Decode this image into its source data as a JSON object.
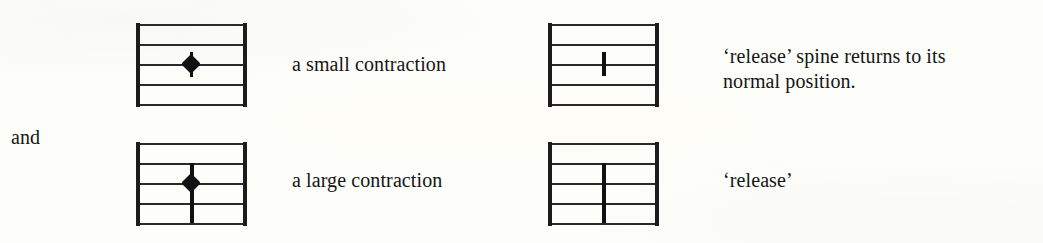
{
  "figure": {
    "background_color": "#fdfdfa",
    "ink_color": "#1a1a1a",
    "connector_label": "and"
  },
  "labels": {
    "small_contraction": "a small contraction",
    "large_contraction": "a large contraction",
    "release_long": "‘release’ spine returns to its\nnormal position.",
    "release_short": "‘release’"
  },
  "staves": [
    {
      "id": "staff-small-contraction",
      "position": "top-left",
      "line_count": 5,
      "notation": "diamond-notehead-with-short-nubs",
      "notehead": "diamond",
      "stem": "short",
      "label": "a small contraction"
    },
    {
      "id": "staff-large-contraction",
      "position": "bottom-left",
      "line_count": 5,
      "notation": "diamond-notehead-with-long-stem",
      "notehead": "diamond",
      "stem": "long",
      "label": "a large contraction"
    },
    {
      "id": "staff-release-small",
      "position": "top-right",
      "line_count": 5,
      "notation": "short-vertical-tick",
      "notehead": "none",
      "stem": "short",
      "label": "‘release’ spine returns to its normal position."
    },
    {
      "id": "staff-release-large",
      "position": "bottom-right",
      "line_count": 5,
      "notation": "long-vertical-stroke",
      "notehead": "none",
      "stem": "long",
      "label": "‘release’"
    }
  ]
}
